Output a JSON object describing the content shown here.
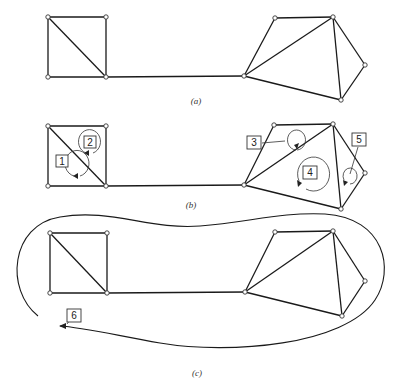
{
  "figure": {
    "panels": [
      {
        "id": "a",
        "caption": "(a)",
        "loops": []
      },
      {
        "id": "b",
        "caption": "(b)",
        "loops": [
          {
            "label": "1",
            "region": "lower-left triangle of square"
          },
          {
            "label": "2",
            "region": "upper-right triangle of square"
          },
          {
            "label": "3",
            "region": "upper triangle of right graph"
          },
          {
            "label": "4",
            "region": "lower triangle of right graph"
          },
          {
            "label": "5",
            "region": "right triangle of right graph"
          }
        ]
      },
      {
        "id": "c",
        "caption": "(c)",
        "loops": [
          {
            "label": "6",
            "region": "outer loop around entire graph"
          }
        ]
      }
    ],
    "graph": {
      "nodes": [
        "sq_tl",
        "sq_tr",
        "sq_bl",
        "sq_br",
        "A",
        "B",
        "C",
        "D",
        "E"
      ],
      "edges": [
        [
          "sq_tl",
          "sq_tr"
        ],
        [
          "sq_tl",
          "sq_bl"
        ],
        [
          "sq_tr",
          "sq_br"
        ],
        [
          "sq_bl",
          "sq_br"
        ],
        [
          "sq_tl",
          "sq_br"
        ],
        [
          "sq_br",
          "A"
        ],
        [
          "A",
          "B"
        ],
        [
          "B",
          "C"
        ],
        [
          "A",
          "C"
        ],
        [
          "A",
          "E"
        ],
        [
          "C",
          "E"
        ],
        [
          "C",
          "D"
        ],
        [
          "D",
          "E"
        ]
      ]
    },
    "colors": {
      "line": "#1a1a1a",
      "node_fill": "#ffffff",
      "background": "#ffffff"
    }
  }
}
